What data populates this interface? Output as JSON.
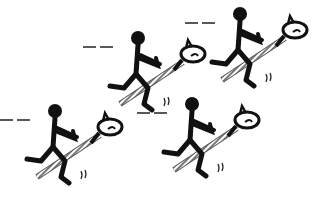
{
  "image": {
    "description": "Black-and-white clip art of four stick-figure children riding hobby horses (stick horses), running toward the right",
    "background_color": "#ffffff",
    "ink_color": "#111111",
    "pole_color": "#888888",
    "figures": [
      {
        "name": "rider-top-middle"
      },
      {
        "name": "rider-top-right"
      },
      {
        "name": "rider-bottom-left"
      },
      {
        "name": "rider-bottom-middle"
      }
    ]
  }
}
